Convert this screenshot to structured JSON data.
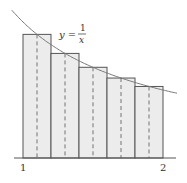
{
  "diagram": {
    "function_label": {
      "lhs": "y =",
      "numerator": "1",
      "denominator": "x"
    },
    "x_ticks": [
      {
        "label": "1",
        "value": 1
      },
      {
        "label": "2",
        "value": 2
      }
    ],
    "rectangles": [
      {
        "x0": 1.0,
        "x1": 1.2,
        "midpoint": 1.1,
        "height": 0.909
      },
      {
        "x0": 1.2,
        "x1": 1.4,
        "midpoint": 1.3,
        "height": 0.769
      },
      {
        "x0": 1.4,
        "x1": 1.6,
        "midpoint": 1.5,
        "height": 0.667
      },
      {
        "x0": 1.6,
        "x1": 1.8,
        "midpoint": 1.7,
        "height": 0.588
      },
      {
        "x0": 1.8,
        "x1": 2.0,
        "midpoint": 1.9,
        "height": 0.526
      }
    ],
    "colors": {
      "fill": "#ececec",
      "stroke": "#555555",
      "curve": "#777777"
    }
  }
}
